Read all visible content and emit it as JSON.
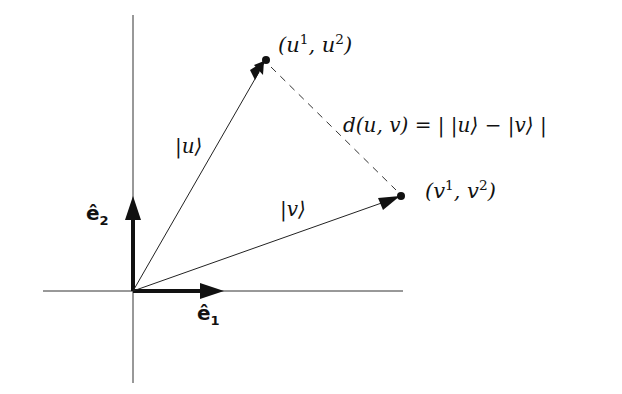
{
  "diagram": {
    "type": "vector-diagram",
    "colors": {
      "ink": "#111111",
      "background": "#ffffff"
    },
    "axes": {
      "origin": [
        133,
        291
      ],
      "horizontal": {
        "x1": 43,
        "x2": 403,
        "y": 291
      },
      "vertical": {
        "x": 133,
        "y1": 15,
        "y2": 383
      }
    },
    "basis": {
      "e1": {
        "label_base": "ê",
        "label_sub": "1",
        "tip": [
          223,
          291
        ]
      },
      "e2": {
        "label_base": "ê",
        "label_sub": "2",
        "tip": [
          133,
          197
        ]
      }
    },
    "vectors": {
      "u": {
        "label": "|u⟩",
        "tip": [
          266,
          60
        ],
        "point_label_open": "(u",
        "point_sup1": "1",
        "point_mid": ", u",
        "point_sup2": "2",
        "point_close": ")"
      },
      "v": {
        "label": "|v⟩",
        "tip": [
          401,
          196
        ],
        "point_label_open": "(v",
        "point_sup1": "1",
        "point_mid": ", v",
        "point_sup2": "2",
        "point_close": ")"
      }
    },
    "distance": {
      "label": "d(u, v) = | |u⟩ − |v⟩ |",
      "style": "dashed"
    }
  }
}
